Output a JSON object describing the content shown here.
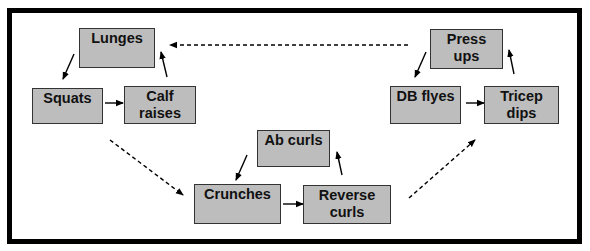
{
  "diagram": {
    "type": "circuit-workout-flow",
    "colors": {
      "box_fill": "#bdbdbd",
      "box_border": "#333333",
      "frame": "#000000",
      "arrow": "#000000"
    },
    "groups": [
      {
        "name": "legs",
        "nodes": [
          {
            "id": "lunges",
            "label": "Lunges"
          },
          {
            "id": "squats",
            "label": "Squats"
          },
          {
            "id": "calf_raises",
            "label": "Calf\nraises"
          }
        ]
      },
      {
        "name": "abs",
        "nodes": [
          {
            "id": "ab_curls",
            "label": "Ab curls"
          },
          {
            "id": "crunches",
            "label": "Crunches"
          },
          {
            "id": "reverse_curls",
            "label": "Reverse\ncurls"
          }
        ]
      },
      {
        "name": "upper",
        "nodes": [
          {
            "id": "press_ups",
            "label": "Press\nups"
          },
          {
            "id": "db_flyes",
            "label": "DB flyes"
          },
          {
            "id": "tricep_dips",
            "label": "Tricep\ndips"
          }
        ]
      }
    ],
    "edges": [
      {
        "from": "lunges",
        "to": "squats",
        "style": "solid"
      },
      {
        "from": "squats",
        "to": "calf_raises",
        "style": "solid"
      },
      {
        "from": "calf_raises",
        "to": "lunges",
        "style": "solid"
      },
      {
        "from": "calf_raises",
        "to": "crunches",
        "style": "dashed"
      },
      {
        "from": "ab_curls",
        "to": "crunches",
        "style": "solid"
      },
      {
        "from": "crunches",
        "to": "reverse_curls",
        "style": "solid"
      },
      {
        "from": "reverse_curls",
        "to": "ab_curls",
        "style": "solid"
      },
      {
        "from": "reverse_curls",
        "to": "tricep_dips",
        "style": "dashed"
      },
      {
        "from": "press_ups",
        "to": "db_flyes",
        "style": "solid"
      },
      {
        "from": "db_flyes",
        "to": "tricep_dips",
        "style": "solid"
      },
      {
        "from": "tricep_dips",
        "to": "press_ups",
        "style": "solid"
      },
      {
        "from": "press_ups",
        "to": "lunges",
        "style": "dashed"
      }
    ]
  },
  "labels": {
    "lunges": "Lunges",
    "squats": "Squats",
    "calf_raises_1": "Calf",
    "calf_raises_2": "raises",
    "ab_curls": "Ab curls",
    "crunches": "Crunches",
    "reverse_curls_1": "Reverse",
    "reverse_curls_2": "curls",
    "press_ups_1": "Press",
    "press_ups_2": "ups",
    "db_flyes": "DB flyes",
    "tricep_dips_1": "Tricep",
    "tricep_dips_2": "dips"
  }
}
